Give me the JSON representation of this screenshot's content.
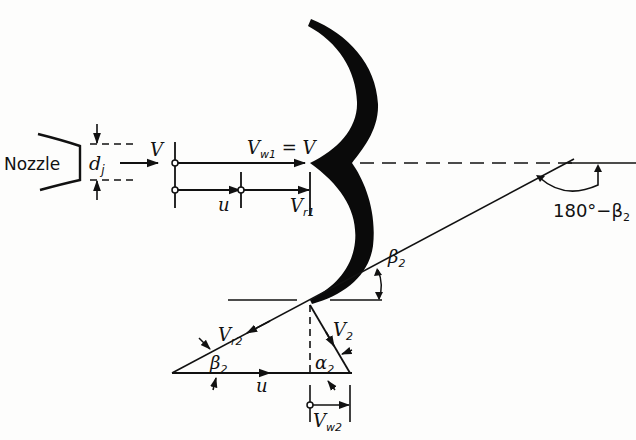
{
  "diagram": {
    "colors": {
      "ink": "#111111",
      "background": "#fdfdfc"
    },
    "labels": {
      "nozzle": "Nozzle",
      "jet_diameter": {
        "main": "d",
        "sub": "j"
      },
      "jet_velocity": "V",
      "inlet_whirl": {
        "main": "V",
        "sub": "w1",
        "suffix": " = V"
      },
      "blade_speed_inlet": "u",
      "inlet_relative": {
        "main": "V",
        "sub": "r1"
      },
      "outlet_angle_supplement": {
        "main": "180°−β",
        "sub": "2"
      },
      "outlet_angle_top": {
        "main": "β",
        "sub": "2"
      },
      "outlet_relative": {
        "main": "V",
        "sub": "r2"
      },
      "outlet_absolute": {
        "main": "V",
        "sub": "2"
      },
      "outlet_angle_bottom": {
        "main": "β",
        "sub": "2"
      },
      "outlet_absolute_angle": {
        "main": "α",
        "sub": "2"
      },
      "blade_speed_outlet": "u",
      "outlet_whirl": {
        "main": "V",
        "sub": "w2"
      }
    }
  }
}
